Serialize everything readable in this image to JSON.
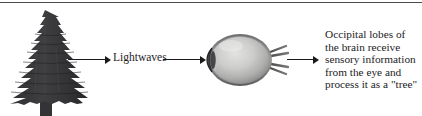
{
  "figure": {
    "type": "process-flow-diagram",
    "topic": "visual perception pathway",
    "divider": {
      "name": "top-rule",
      "color": "#4a4a4c"
    }
  },
  "nodes": {
    "tree": {
      "icon": "evergreen-tree-icon",
      "label": "",
      "color": "#3a3a3c"
    },
    "eye": {
      "icon": "eye-anatomy-icon",
      "label": "",
      "colors": {
        "outline": "#4c4c4e",
        "sclera_light": "#d8d8d6",
        "sclera_mid": "#b4b4b2",
        "sclera_dark": "#7e7e80",
        "cornea": "#3c3c3e",
        "optic_nerve": "#5e5e60"
      }
    }
  },
  "labels": {
    "lightwaves": "Lightwaves"
  },
  "caption": {
    "lines": [
      "Occipital lobes of",
      "the brain receive",
      "sensory information",
      "from the eye and",
      "process it as a \"tree\""
    ]
  },
  "arrows": [
    {
      "name": "arrow-tree-to-lightwaves",
      "direction": "right",
      "color": "#19191b"
    },
    {
      "name": "arrow-lightwaves-to-eye",
      "direction": "right",
      "color": "#19191b"
    },
    {
      "name": "arrow-eye-to-brain",
      "direction": "right",
      "color": "#19191b"
    }
  ]
}
